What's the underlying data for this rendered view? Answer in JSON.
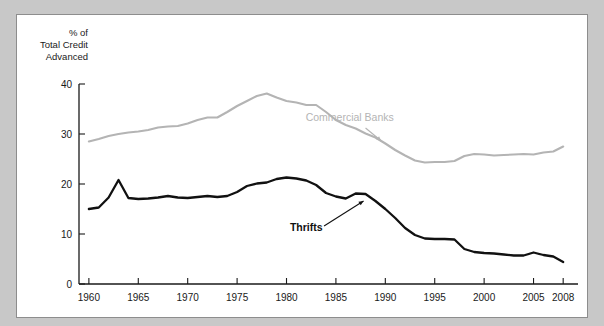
{
  "figure": {
    "background_color": "#c8c8c8",
    "panel_color": "#ffffff",
    "border_color": "#8d8d8d"
  },
  "chart_data": {
    "type": "line",
    "title": "",
    "subtitle": "",
    "xlabel": "",
    "ylabel": "% of\nTotal Credit\nAdvanced",
    "ylabel_lines": [
      "% of",
      "Total Credit",
      "Advanced"
    ],
    "xlim": [
      1959,
      2009.5
    ],
    "ylim": [
      0,
      40
    ],
    "yticks": [
      0,
      10,
      20,
      30,
      40
    ],
    "ytick_labels": [
      "0",
      "10",
      "20",
      "30",
      "40"
    ],
    "xticks": [
      1960,
      1965,
      1970,
      1975,
      1980,
      1985,
      1990,
      1995,
      2000,
      2005,
      2008
    ],
    "xtick_labels": [
      "1960",
      "1965",
      "1970",
      "1975",
      "1980",
      "1985",
      "1990",
      "1995",
      "2000",
      "2005",
      "2008"
    ],
    "grid": false,
    "legend": "inline-annotations",
    "series": [
      {
        "name": "Commercial Banks",
        "color": "#b4b4b4",
        "line_width": 2.1,
        "label_position": {
          "x": 1986.4,
          "y": 32.6
        },
        "leader_line": {
          "from": [
            1988.0,
            31.2
          ],
          "to": [
            1989.6,
            28.6
          ]
        },
        "x": [
          1960,
          1961,
          1962,
          1963,
          1964,
          1965,
          1966,
          1967,
          1968,
          1969,
          1970,
          1971,
          1972,
          1973,
          1974,
          1975,
          1976,
          1977,
          1978,
          1979,
          1980,
          1981,
          1982,
          1983,
          1984,
          1985,
          1986,
          1987,
          1988,
          1989,
          1990,
          1991,
          1992,
          1993,
          1994,
          1995,
          1996,
          1997,
          1998,
          1999,
          2000,
          2001,
          2002,
          2003,
          2004,
          2005,
          2006,
          2007,
          2008
        ],
        "values": [
          28.5,
          29.0,
          29.6,
          30.0,
          30.3,
          30.5,
          30.8,
          31.3,
          31.5,
          31.6,
          32.1,
          32.8,
          33.3,
          33.3,
          34.4,
          35.6,
          36.6,
          37.6,
          38.1,
          37.3,
          36.6,
          36.3,
          35.8,
          35.8,
          34.4,
          32.8,
          31.8,
          31.1,
          30.1,
          29.3,
          28.1,
          26.8,
          25.7,
          24.7,
          24.3,
          24.4,
          24.4,
          24.6,
          25.6,
          26.0,
          25.9,
          25.7,
          25.8,
          25.9,
          26.0,
          25.9,
          26.3,
          26.5,
          27.5
        ]
      },
      {
        "name": "Thrifts",
        "color": "#111111",
        "line_width": 2.3,
        "label_position": {
          "x": 1982.0,
          "y": 10.6
        },
        "leader_line": {
          "from": [
            1983.8,
            11.6
          ],
          "to": [
            1987.8,
            16.6
          ]
        },
        "x": [
          1960,
          1961,
          1962,
          1963,
          1964,
          1965,
          1966,
          1967,
          1968,
          1969,
          1970,
          1971,
          1972,
          1973,
          1974,
          1975,
          1976,
          1977,
          1978,
          1979,
          1980,
          1981,
          1982,
          1983,
          1984,
          1985,
          1986,
          1987,
          1988,
          1989,
          1990,
          1991,
          1992,
          1993,
          1994,
          1995,
          1996,
          1997,
          1998,
          1999,
          2000,
          2001,
          2002,
          2003,
          2004,
          2005,
          2006,
          2007,
          2008
        ],
        "values": [
          15.0,
          15.3,
          17.3,
          20.8,
          17.2,
          17.0,
          17.1,
          17.3,
          17.6,
          17.3,
          17.2,
          17.4,
          17.6,
          17.4,
          17.6,
          18.4,
          19.6,
          20.1,
          20.3,
          21.0,
          21.3,
          21.1,
          20.7,
          19.8,
          18.2,
          17.5,
          17.1,
          18.1,
          18.0,
          16.6,
          15.0,
          13.2,
          11.2,
          9.8,
          9.1,
          9.0,
          9.0,
          8.9,
          7.0,
          6.4,
          6.2,
          6.1,
          5.9,
          5.7,
          5.7,
          6.3,
          5.8,
          5.5,
          4.4
        ]
      }
    ]
  }
}
